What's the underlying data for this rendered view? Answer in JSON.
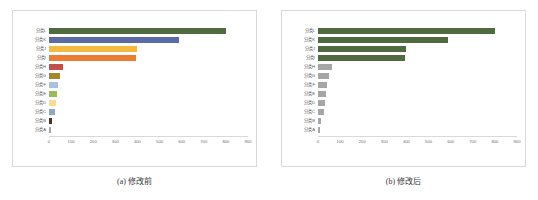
{
  "figure": {
    "panels": [
      {
        "id": "panel-a",
        "caption": "(a) 修改前",
        "chart_ref": 0
      },
      {
        "id": "panel-b",
        "caption": "(b) 修改后",
        "chart_ref": 1
      }
    ]
  },
  "chart_data": [
    {
      "type": "bar",
      "orientation": "horizontal",
      "title": "",
      "xlabel": "",
      "ylabel": "",
      "xlim": [
        0,
        900
      ],
      "xticks": [
        "0",
        "100",
        "200",
        "300",
        "400",
        "500",
        "600",
        "700",
        "800",
        "900"
      ],
      "grid": false,
      "legend": "none",
      "categories": [
        "分类L",
        "分类K",
        "分类J",
        "分类I",
        "分类H",
        "分类G",
        "分类F",
        "分类E",
        "分类D",
        "分类C",
        "分类B",
        "分类A"
      ],
      "values": [
        800,
        590,
        398,
        392,
        65,
        50,
        42,
        38,
        32,
        28,
        12,
        8
      ],
      "colors": [
        "#4f6b3f",
        "#5b6ba8",
        "#f5b942",
        "#ed7d31",
        "#c0504d",
        "#a6862c",
        "#a9c0de",
        "#9bbb59",
        "#f7dd8f",
        "#8fa8c8",
        "#4a3326",
        "#a6a6a6"
      ]
    },
    {
      "type": "bar",
      "orientation": "horizontal",
      "title": "",
      "xlabel": "",
      "ylabel": "",
      "xlim": [
        0,
        900
      ],
      "xticks": [
        "0",
        "100",
        "200",
        "300",
        "400",
        "500",
        "600",
        "700",
        "800",
        "900"
      ],
      "grid": false,
      "legend": "none",
      "categories": [
        "分类L",
        "分类K",
        "分类J",
        "分类I",
        "分类H",
        "分类G",
        "分类F",
        "分类E",
        "分类D",
        "分类C",
        "分类B",
        "分类A"
      ],
      "values": [
        800,
        590,
        398,
        392,
        65,
        50,
        42,
        38,
        32,
        28,
        12,
        8
      ],
      "colors": [
        "#4f6b3f",
        "#4f6b3f",
        "#4f6b3f",
        "#4f6b3f",
        "#a6a6a6",
        "#a6a6a6",
        "#a6a6a6",
        "#a6a6a6",
        "#a6a6a6",
        "#a6a6a6",
        "#a6a6a6",
        "#a6a6a6"
      ]
    }
  ]
}
